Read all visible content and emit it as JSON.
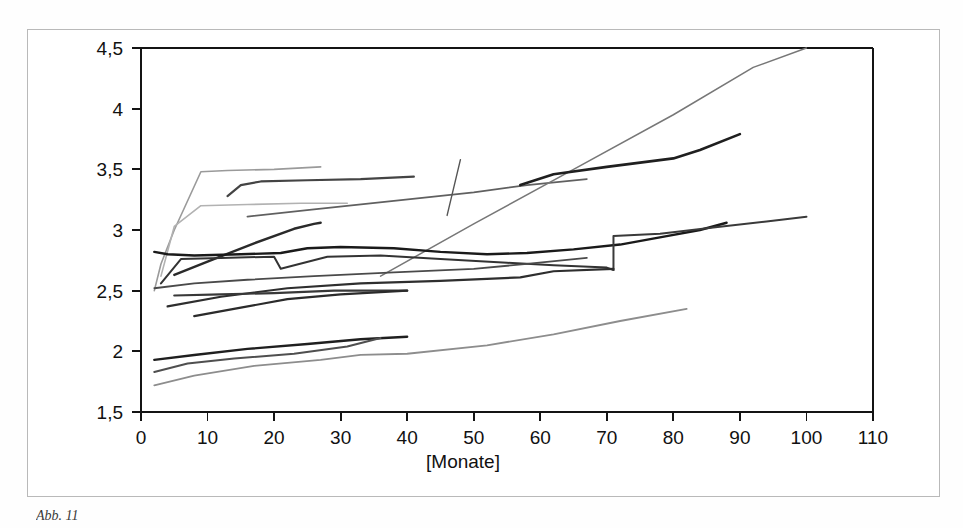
{
  "figure": {
    "caption": "Abb. 11",
    "frame_color": "#b9b9b9",
    "background": "#ffffff"
  },
  "chart_data": {
    "type": "line",
    "title": "",
    "subtitle": "",
    "xlabel": "[Monate]",
    "ylabel": "",
    "xlim": [
      0,
      110
    ],
    "ylim": [
      1.5,
      4.5
    ],
    "xticks": [
      0,
      10,
      20,
      30,
      40,
      50,
      60,
      70,
      80,
      90,
      100,
      110
    ],
    "xtick_labels": [
      "0",
      "10",
      "20",
      "30",
      "40",
      "50",
      "60",
      "70",
      "80",
      "90",
      "100",
      "110"
    ],
    "yticks": [
      1.5,
      2,
      2.5,
      3,
      3.5,
      4,
      4.5
    ],
    "ytick_labels": [
      "1,5",
      "2",
      "2,5",
      "3",
      "3,5",
      "4",
      "4,5"
    ],
    "grid": false,
    "legend": null,
    "legend_position": "none",
    "axis_color": "#141414",
    "annotations": [],
    "series": [
      {
        "name": "Serie 1",
        "color": "#9a9a9a",
        "width": 1.6,
        "x": [
          2,
          3,
          5,
          9,
          13,
          20,
          27
        ],
        "values": [
          2.5,
          2.72,
          3.0,
          3.48,
          3.49,
          3.5,
          3.52
        ]
      },
      {
        "name": "Serie 2",
        "color": "#444444",
        "width": 2.2,
        "x": [
          13,
          15,
          18,
          25,
          33,
          41
        ],
        "values": [
          3.28,
          3.37,
          3.4,
          3.41,
          3.42,
          3.44
        ]
      },
      {
        "name": "Serie 3",
        "color": "#b2b2b2",
        "width": 1.6,
        "x": [
          3,
          5,
          9,
          16,
          24,
          31
        ],
        "values": [
          2.62,
          3.03,
          3.2,
          3.21,
          3.22,
          3.22
        ]
      },
      {
        "name": "Serie 4",
        "color": "#606060",
        "width": 1.8,
        "x": [
          16,
          26,
          38,
          50,
          58,
          67
        ],
        "values": [
          3.11,
          3.17,
          3.24,
          3.31,
          3.37,
          3.42
        ]
      },
      {
        "name": "Serie 5",
        "color": "#555555",
        "width": 1.4,
        "x": [
          46,
          48
        ],
        "values": [
          3.12,
          3.58
        ]
      },
      {
        "name": "Serie 6",
        "color": "#777777",
        "width": 1.5,
        "x": [
          36,
          50,
          65,
          80,
          92,
          100
        ],
        "values": [
          2.62,
          3.05,
          3.5,
          3.95,
          4.34,
          4.5
        ]
      },
      {
        "name": "Serie 7",
        "color": "#1f1f1f",
        "width": 2.6,
        "x": [
          57,
          62,
          70,
          80,
          84,
          90
        ],
        "values": [
          3.37,
          3.46,
          3.52,
          3.59,
          3.66,
          3.79
        ]
      },
      {
        "name": "Serie 8",
        "color": "#2a2a2a",
        "width": 2.4,
        "x": [
          5,
          10,
          17,
          23,
          26,
          27
        ],
        "values": [
          2.63,
          2.74,
          2.89,
          3.01,
          3.05,
          3.06
        ]
      },
      {
        "name": "Serie 9",
        "color": "#1a1a1a",
        "width": 2.4,
        "x": [
          2,
          4,
          8,
          15,
          21,
          25,
          30,
          38,
          45,
          52,
          58,
          65,
          72,
          79,
          84,
          88
        ],
        "values": [
          2.82,
          2.8,
          2.79,
          2.8,
          2.81,
          2.85,
          2.86,
          2.85,
          2.82,
          2.8,
          2.81,
          2.84,
          2.88,
          2.95,
          3.0,
          3.06
        ]
      },
      {
        "name": "Serie 10",
        "color": "#333333",
        "width": 2.0,
        "x": [
          3,
          6,
          12,
          20,
          21,
          28,
          36,
          45,
          55,
          62,
          70,
          71
        ],
        "values": [
          2.56,
          2.76,
          2.77,
          2.78,
          2.68,
          2.78,
          2.79,
          2.76,
          2.73,
          2.71,
          2.69,
          2.67
        ]
      },
      {
        "name": "Serie 11",
        "color": "#3a3a3a",
        "width": 2.0,
        "x": [
          71,
          71,
          78,
          86,
          94,
          100
        ],
        "values": [
          2.67,
          2.95,
          2.97,
          3.02,
          3.07,
          3.11
        ]
      },
      {
        "name": "Serie 12",
        "color": "#4a4a4a",
        "width": 1.8,
        "x": [
          2,
          8,
          16,
          26,
          38,
          50,
          58,
          67
        ],
        "values": [
          2.52,
          2.56,
          2.59,
          2.62,
          2.65,
          2.68,
          2.72,
          2.77
        ]
      },
      {
        "name": "Serie 13",
        "color": "#2e2e2e",
        "width": 2.2,
        "x": [
          4,
          12,
          22,
          33,
          45,
          57,
          62,
          71
        ],
        "values": [
          2.37,
          2.45,
          2.52,
          2.56,
          2.58,
          2.61,
          2.66,
          2.68
        ]
      },
      {
        "name": "Serie 14",
        "color": "#383838",
        "width": 2.2,
        "x": [
          5,
          12,
          20,
          29,
          34,
          40
        ],
        "values": [
          2.46,
          2.47,
          2.48,
          2.5,
          2.5,
          2.5
        ]
      },
      {
        "name": "Serie 15",
        "color": "#2b2b2b",
        "width": 2.2,
        "x": [
          8,
          15,
          22,
          30,
          40
        ],
        "values": [
          2.29,
          2.36,
          2.43,
          2.47,
          2.5
        ]
      },
      {
        "name": "Serie 16",
        "color": "#1f1f1f",
        "width": 2.4,
        "x": [
          2,
          8,
          16,
          25,
          33,
          40
        ],
        "values": [
          1.93,
          1.97,
          2.02,
          2.06,
          2.1,
          2.12
        ]
      },
      {
        "name": "Serie 17",
        "color": "#4f4f4f",
        "width": 2.0,
        "x": [
          2,
          7,
          14,
          23,
          31,
          36
        ],
        "values": [
          1.83,
          1.9,
          1.94,
          1.98,
          2.04,
          2.11
        ]
      },
      {
        "name": "Serie 18",
        "color": "#8d8d8d",
        "width": 1.8,
        "x": [
          2,
          8,
          17,
          27,
          33,
          40,
          52,
          62,
          72,
          82
        ],
        "values": [
          1.72,
          1.8,
          1.88,
          1.93,
          1.97,
          1.98,
          2.05,
          2.14,
          2.25,
          2.35
        ]
      }
    ]
  },
  "axis": {
    "x_title": "[Monate]"
  }
}
